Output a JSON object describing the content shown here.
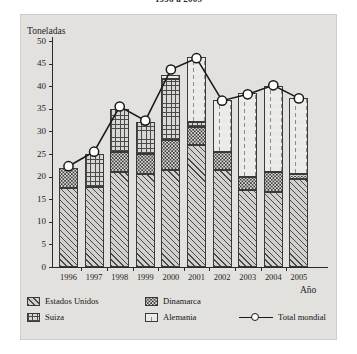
{
  "chart_data": {
    "type": "bar",
    "title": "1996 a 2005",
    "xlabel": "Año",
    "ylabel": "Toneladas",
    "ylim": [
      0,
      50
    ],
    "ytick_step": 5,
    "yticks": [
      0,
      5,
      10,
      15,
      20,
      25,
      30,
      35,
      40,
      45,
      50
    ],
    "grid": false,
    "legend_position": "bottom",
    "stacked": true,
    "categories": [
      "1996",
      "1997",
      "1998",
      "1999",
      "2000",
      "2001",
      "2002",
      "2003",
      "2004",
      "2005"
    ],
    "series": [
      {
        "name": "Estados Unidos",
        "pattern": "diagonal-hatch",
        "values": [
          17.5,
          17.8,
          21.0,
          20.5,
          21.5,
          27.0,
          21.5,
          17.0,
          16.5,
          19.5
        ]
      },
      {
        "name": "Dinamarca",
        "pattern": "dotted",
        "values": [
          4.5,
          0.0,
          4.5,
          4.5,
          6.5,
          4.0,
          4.0,
          3.0,
          4.5,
          1.0
        ]
      },
      {
        "name": "Suiza",
        "pattern": "cross-hatch",
        "values": [
          0.0,
          7.2,
          9.5,
          7.0,
          13.5,
          1.0,
          0.0,
          0.0,
          0.0,
          0.0
        ]
      },
      {
        "name": "Alemania",
        "pattern": "blank",
        "values": [
          0.0,
          0.0,
          0.0,
          0.0,
          1.0,
          14.5,
          11.5,
          18.5,
          19.0,
          17.0
        ]
      }
    ],
    "overlay_line": {
      "name": "Total mondial",
      "marker": "open-circle",
      "values": [
        22.3,
        25.5,
        35.5,
        32.4,
        43.7,
        46.2,
        36.8,
        38.2,
        40.2,
        37.3
      ]
    }
  },
  "legend": {
    "items": [
      {
        "label": "Estados Unidos",
        "type": "swatch",
        "pattern": "diagonal-hatch"
      },
      {
        "label": "Dinamarca",
        "type": "swatch",
        "pattern": "dotted"
      },
      {
        "label": "Suiza",
        "type": "swatch",
        "pattern": "cross-hatch"
      },
      {
        "label": "Alemania",
        "type": "swatch",
        "pattern": "blank"
      },
      {
        "label": "Total mondial",
        "type": "line",
        "pattern": "line-open-circle"
      }
    ]
  },
  "colors": {
    "ink": "#1a1a1a",
    "panel": "#e2e1de",
    "page": "#ffffff",
    "hatch": "#4a4a4a",
    "marker_fill": "#ffffff"
  }
}
